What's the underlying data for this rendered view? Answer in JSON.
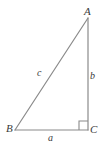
{
  "figure": {
    "type": "right-triangle-diagram",
    "background_color": "#ffffff",
    "stroke_color": "#8a8a8a",
    "label_color": "#3a3a3a",
    "stroke_width": 1.2,
    "canvas": {
      "width": 100,
      "height": 146
    },
    "vertices": [
      {
        "id": "A",
        "label": "A",
        "x": 88,
        "y": 18,
        "description": "top-right apex"
      },
      {
        "id": "B",
        "label": "B",
        "x": 15,
        "y": 130,
        "description": "bottom-left vertex"
      },
      {
        "id": "C",
        "label": "C",
        "x": 88,
        "y": 130,
        "description": "bottom-right vertex, right angle"
      }
    ],
    "sides": [
      {
        "id": "a",
        "label": "a",
        "from": "B",
        "to": "C",
        "role": "base",
        "orientation": "horizontal"
      },
      {
        "id": "b",
        "label": "b",
        "from": "A",
        "to": "C",
        "role": "height",
        "orientation": "vertical"
      },
      {
        "id": "c",
        "label": "c",
        "from": "B",
        "to": "A",
        "role": "hypotenuse",
        "orientation": "diagonal"
      }
    ],
    "right_angle": {
      "at_vertex": "C",
      "marker": "square",
      "size": 9,
      "x": 79,
      "y": 121
    }
  }
}
